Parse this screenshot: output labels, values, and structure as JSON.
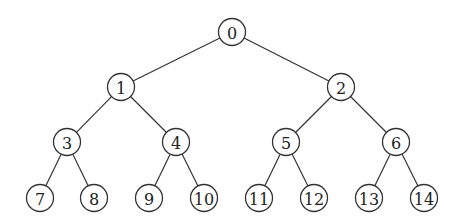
{
  "diagram": {
    "type": "binary-tree",
    "colors": {
      "stroke": "#333333",
      "fill": "#ffffff",
      "text": "#222222"
    },
    "radius": 13.5,
    "nodes": [
      {
        "id": 0,
        "label": "0",
        "x": 232,
        "y": 32
      },
      {
        "id": 1,
        "label": "1",
        "x": 121,
        "y": 87
      },
      {
        "id": 2,
        "label": "2",
        "x": 341,
        "y": 87
      },
      {
        "id": 3,
        "label": "3",
        "x": 67,
        "y": 142
      },
      {
        "id": 4,
        "label": "4",
        "x": 176,
        "y": 142
      },
      {
        "id": 5,
        "label": "5",
        "x": 286,
        "y": 142
      },
      {
        "id": 6,
        "label": "6",
        "x": 396,
        "y": 142
      },
      {
        "id": 7,
        "label": "7",
        "x": 40,
        "y": 198
      },
      {
        "id": 8,
        "label": "8",
        "x": 94,
        "y": 198
      },
      {
        "id": 9,
        "label": "9",
        "x": 149,
        "y": 198
      },
      {
        "id": 10,
        "label": "10",
        "x": 204,
        "y": 198
      },
      {
        "id": 11,
        "label": "11",
        "x": 259,
        "y": 198
      },
      {
        "id": 12,
        "label": "12",
        "x": 314,
        "y": 198
      },
      {
        "id": 13,
        "label": "13",
        "x": 369,
        "y": 198
      },
      {
        "id": 14,
        "label": "14",
        "x": 424,
        "y": 198
      }
    ],
    "edges": [
      [
        0,
        1
      ],
      [
        0,
        2
      ],
      [
        1,
        3
      ],
      [
        1,
        4
      ],
      [
        2,
        5
      ],
      [
        2,
        6
      ],
      [
        3,
        7
      ],
      [
        3,
        8
      ],
      [
        4,
        9
      ],
      [
        4,
        10
      ],
      [
        5,
        11
      ],
      [
        5,
        12
      ],
      [
        6,
        13
      ],
      [
        6,
        14
      ]
    ]
  }
}
